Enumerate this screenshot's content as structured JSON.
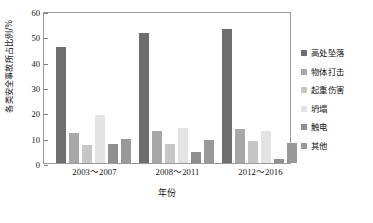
{
  "chart_data": {
    "type": "bar",
    "title": "",
    "xlabel": "年份",
    "ylabel": "各类安全事故所占比例/%",
    "ylim": [
      0,
      60
    ],
    "yticks": [
      0,
      10,
      20,
      30,
      40,
      50,
      60
    ],
    "grid": false,
    "legend_position": "right",
    "categories": [
      "2003～2007",
      "2008～2011",
      "2012～2016"
    ],
    "series": [
      {
        "name": "高处坠落",
        "color": "#6e6e6e",
        "values": [
          45.7,
          51.2,
          53.0
        ]
      },
      {
        "name": "物体打击",
        "color": "#a8a8a8",
        "values": [
          11.8,
          12.7,
          13.3
        ]
      },
      {
        "name": "起重伤害",
        "color": "#c6c6c6",
        "values": [
          7.0,
          7.4,
          8.6
        ]
      },
      {
        "name": "坍塌",
        "color": "#e3e3e3",
        "values": [
          18.8,
          14.0,
          12.8
        ]
      },
      {
        "name": "触电",
        "color": "#8f8f8f",
        "values": [
          7.4,
          4.4,
          1.6
        ]
      },
      {
        "name": "其他",
        "color": "#999999",
        "values": [
          9.3,
          8.9,
          8.0
        ]
      }
    ]
  },
  "axes": {
    "y_title": "各类安全事故所占比例/%",
    "x_title": "年份",
    "y_tick_labels": [
      "0",
      "10",
      "20",
      "30",
      "40",
      "50",
      "60"
    ],
    "x_tick_labels": [
      "2003～2007",
      "2008～2011",
      "2012～2016"
    ]
  },
  "legend": {
    "items": [
      {
        "label": "高处坠落"
      },
      {
        "label": "物体打击"
      },
      {
        "label": "起重伤害"
      },
      {
        "label": "坍塌"
      },
      {
        "label": "触电"
      },
      {
        "label": "其他"
      }
    ]
  },
  "colors": {
    "frame": "#9a9a9a",
    "background": "#ffffff",
    "text": "#141414"
  }
}
